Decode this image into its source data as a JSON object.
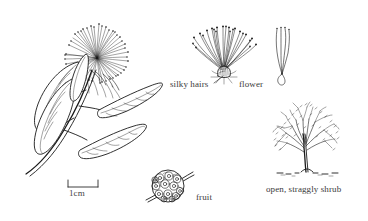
{
  "figure": {
    "type": "botanical-line-illustration",
    "background_color": "#ffffff",
    "ink_color": "#1a1a1a",
    "text_color": "#3a3a3a"
  },
  "labels": {
    "silky_hairs": "silky hairs",
    "flower": "flower",
    "fruit": "fruit",
    "shrub": "open, straggly shrub"
  },
  "scale_bar": {
    "label": "1cm",
    "length_px": 30
  },
  "panels": [
    {
      "name": "flowering-branch",
      "label": "",
      "position": "left"
    },
    {
      "name": "flower-detail",
      "label": "flower",
      "position": "top-center"
    },
    {
      "name": "stamen-detail",
      "label": "",
      "position": "top-right"
    },
    {
      "name": "fruit-detail",
      "label": "fruit",
      "position": "bottom-center"
    },
    {
      "name": "habit-shrub",
      "label": "open, straggly shrub",
      "position": "bottom-right"
    }
  ]
}
